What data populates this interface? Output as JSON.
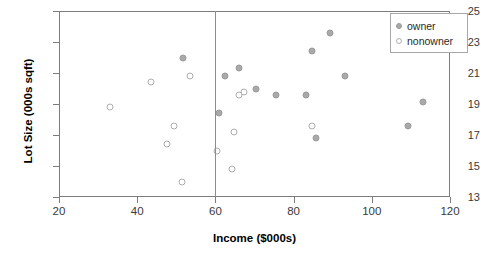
{
  "chart_data": {
    "type": "scatter",
    "title": "",
    "xlabel": "Income ($000s)",
    "ylabel": "Lot Size (000s sqft)",
    "xlim": [
      20,
      120
    ],
    "ylim": [
      13,
      25
    ],
    "xticks": [
      20,
      40,
      60,
      80,
      100,
      120
    ],
    "yticks": [
      13,
      15,
      17,
      19,
      21,
      23,
      25
    ],
    "grid": false,
    "legend_position": "top-right",
    "annotations": [
      {
        "type": "vertical-line",
        "x": 60
      }
    ],
    "series": [
      {
        "name": "owner",
        "marker": "filled-circle",
        "color": "#a9a9a9",
        "points": [
          {
            "x": 51.7,
            "y": 22.0
          },
          {
            "x": 66.0,
            "y": 21.3
          },
          {
            "x": 62.5,
            "y": 20.8
          },
          {
            "x": 70.4,
            "y": 20.0
          },
          {
            "x": 83.2,
            "y": 19.6
          },
          {
            "x": 61.0,
            "y": 18.4
          },
          {
            "x": 84.8,
            "y": 22.4
          },
          {
            "x": 89.3,
            "y": 23.6
          },
          {
            "x": 75.5,
            "y": 19.6
          },
          {
            "x": 85.7,
            "y": 16.8
          },
          {
            "x": 93.1,
            "y": 20.8
          },
          {
            "x": 113.0,
            "y": 19.1
          },
          {
            "x": 109.2,
            "y": 17.6
          }
        ]
      },
      {
        "name": "nonowner",
        "marker": "open-circle",
        "color": "#aeaeae",
        "points": [
          {
            "x": 53.5,
            "y": 20.8
          },
          {
            "x": 43.5,
            "y": 20.4
          },
          {
            "x": 33.0,
            "y": 18.8
          },
          {
            "x": 49.4,
            "y": 17.6
          },
          {
            "x": 47.6,
            "y": 16.4
          },
          {
            "x": 51.5,
            "y": 14.0
          },
          {
            "x": 67.3,
            "y": 19.8
          },
          {
            "x": 66.0,
            "y": 19.6
          },
          {
            "x": 64.8,
            "y": 17.2
          },
          {
            "x": 60.4,
            "y": 16.0
          },
          {
            "x": 64.2,
            "y": 14.8
          },
          {
            "x": 84.6,
            "y": 17.6
          }
        ]
      }
    ]
  },
  "legend": {
    "items": [
      {
        "label": "owner",
        "marker": "filled-circle"
      },
      {
        "label": "nonowner",
        "marker": "open-circle"
      }
    ]
  }
}
